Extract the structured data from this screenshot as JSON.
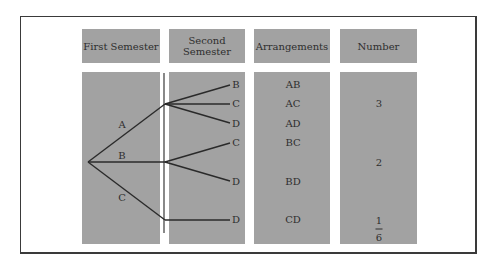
{
  "headers": [
    {
      "label": "First Semester"
    },
    {
      "label": "Second Semester",
      "line1": "Second",
      "line2": "Semester"
    },
    {
      "label": "Arrangements"
    },
    {
      "label": "Number"
    }
  ],
  "tree": {
    "first_branches": [
      {
        "label": "A",
        "second": [
          "B",
          "C",
          "D"
        ]
      },
      {
        "label": "B",
        "second": [
          "C",
          "D"
        ]
      },
      {
        "label": "C",
        "second": [
          "D"
        ]
      }
    ]
  },
  "arrangements": [
    "AB",
    "AC",
    "AD",
    "BC",
    "BD",
    "CD"
  ],
  "numbers": [
    {
      "value": "3",
      "group": "A"
    },
    {
      "value": "2",
      "group": "B"
    },
    {
      "value": "1",
      "group": "C"
    }
  ],
  "fraction": {
    "numerator": "1",
    "denominator": "6"
  },
  "colors": {
    "box_fill": "#a2a2a2",
    "line": "#2a2a2a",
    "frame": "#3a3a3a"
  }
}
